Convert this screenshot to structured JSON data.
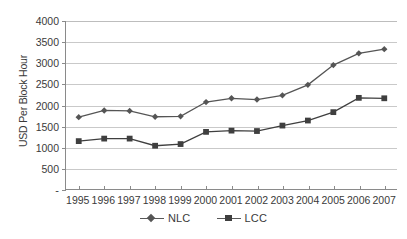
{
  "chart_data": {
    "type": "line",
    "title": "",
    "xlabel": "",
    "ylabel": "USD Per Block Hour",
    "categories": [
      "1995",
      "1996",
      "1997",
      "1998",
      "1999",
      "2000",
      "2001",
      "2002",
      "2003",
      "2004",
      "2005",
      "2006",
      "2007"
    ],
    "series": [
      {
        "name": "NLC",
        "marker": "diamond",
        "color": "#555555",
        "values": [
          1710,
          1870,
          1860,
          1720,
          1730,
          2070,
          2160,
          2130,
          2230,
          2480,
          2950,
          3230,
          3330
        ]
      },
      {
        "name": "LCC",
        "marker": "square",
        "color": "#3f3f3f",
        "values": [
          1140,
          1200,
          1200,
          1030,
          1070,
          1360,
          1390,
          1380,
          1510,
          1630,
          1830,
          2170,
          2160
        ]
      }
    ],
    "ylim": [
      0,
      4000
    ],
    "yticks": [
      0,
      500,
      1000,
      1500,
      2000,
      2500,
      3000,
      3500,
      4000
    ],
    "ytick_labels": [
      "-",
      "500",
      "1000",
      "1500",
      "2000",
      "2500",
      "3000",
      "3500",
      "4000"
    ],
    "grid": true,
    "legend_position": "bottom-center"
  },
  "legend": {
    "entries": [
      {
        "label": "NLC"
      },
      {
        "label": "LCC"
      }
    ]
  },
  "colors": {
    "grid": "#c9c9c9",
    "axis": "#8a8a8a",
    "text": "#3a3a3a",
    "background": "#ffffff"
  }
}
